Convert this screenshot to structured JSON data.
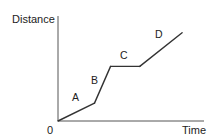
{
  "chart_data": {
    "type": "line",
    "title": "",
    "xlabel": "Time",
    "ylabel": "Distance",
    "origin_label": "0",
    "xlim": [
      0,
      10
    ],
    "ylim": [
      0,
      10
    ],
    "grid": false,
    "series": [
      {
        "name": "distance-time",
        "color": "#333333",
        "points": [
          {
            "x": 0,
            "y": 0
          },
          {
            "x": 2.5,
            "y": 1.7
          },
          {
            "x": 3.6,
            "y": 5.2
          },
          {
            "x": 5.6,
            "y": 5.2
          },
          {
            "x": 8.5,
            "y": 8.4
          }
        ]
      }
    ],
    "annotations": [
      {
        "text": "A",
        "x": 1.2,
        "y": 1.9
      },
      {
        "text": "B",
        "x": 2.5,
        "y": 3.5
      },
      {
        "text": "C",
        "x": 4.5,
        "y": 5.9
      },
      {
        "text": "D",
        "x": 6.9,
        "y": 7.9
      }
    ],
    "axis_color": "#555555"
  }
}
